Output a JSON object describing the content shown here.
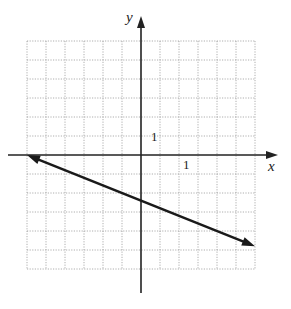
{
  "chart_data": {
    "type": "line",
    "title": "",
    "xlabel": "x",
    "ylabel": "y",
    "xlim": [
      -6,
      6
    ],
    "ylim": [
      -6,
      6
    ],
    "grid": true,
    "tick_labels": {
      "x": "1",
      "y": "1"
    },
    "series": [
      {
        "name": "line",
        "equation": "y = -0.4x - 2.4",
        "points": [
          [
            -6,
            0
          ],
          [
            0,
            -2.4
          ],
          [
            6,
            -4.8
          ]
        ],
        "arrows_both_ends": true
      }
    ]
  },
  "labels": {
    "x_axis": "x",
    "y_axis": "y",
    "x_unit": "1",
    "y_unit": "1"
  },
  "colors": {
    "axis": "#222222",
    "grid": "#9a9a9a",
    "line": "#1a1a1a"
  }
}
